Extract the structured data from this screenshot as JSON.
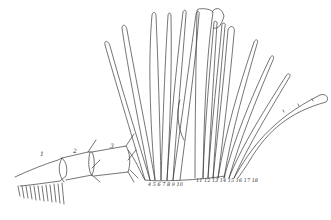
{
  "figure": {
    "type": "scientific line drawing",
    "stroke_color": "#3a3a3a",
    "background": "#ffffff",
    "segment_labels": [
      "1",
      "2",
      "3"
    ],
    "base_numbers_left": "4 5 6 7 8 9 10",
    "base_numbers_right": "11 12 13 14 15 16 17 18",
    "lamella_count_approx": 18
  }
}
